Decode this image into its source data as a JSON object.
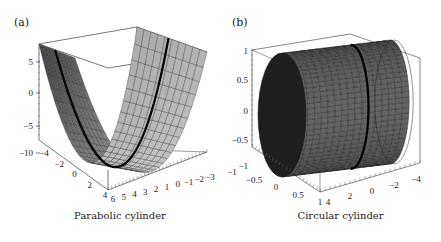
{
  "figure": {
    "panels": [
      {
        "label": "(a)",
        "caption": "Parabolic cylinder"
      },
      {
        "label": "(b)",
        "caption": "Circular cylinder"
      }
    ]
  },
  "chart_data": [
    {
      "type": "surface3d",
      "title": "Parabolic cylinder",
      "panel_label": "(a)",
      "surface": "z = x^2 - c (parabolic cylinder, extruded along y)",
      "z_axis": {
        "ticks": [
          "5",
          "0",
          "-5",
          "-10"
        ],
        "range": [
          -12,
          7
        ]
      },
      "x_axis": {
        "ticks": [
          "-4",
          "-2",
          "0",
          "2",
          "4"
        ],
        "range": [
          -5,
          5
        ]
      },
      "y_axis": {
        "ticks": [
          "6",
          "5",
          "4",
          "3",
          "2",
          "1",
          "0",
          "-1",
          "-2",
          "-3"
        ],
        "range": [
          -3,
          6
        ]
      },
      "highlight_curve": "thick black parabola cross-section drawn on surface",
      "colors": {
        "surface_dark": "#3a3a3a",
        "surface_light": "#cfcfcf",
        "mesh": "#222222",
        "curve": "#000000",
        "box": "#555555"
      }
    },
    {
      "type": "surface3d",
      "title": "Circular cylinder",
      "panel_label": "(b)",
      "surface": "x^2 + z^2 = 1 (circular cylinder, extruded along y)",
      "z_axis": {
        "ticks": [
          "1",
          "0.5",
          "0",
          "-0.5",
          "-1"
        ],
        "range": [
          -1,
          1
        ]
      },
      "x_axis": {
        "ticks": [
          "-1",
          "-0.5",
          "0",
          "0.5",
          "1"
        ],
        "range": [
          -1,
          1
        ]
      },
      "y_axis": {
        "ticks": [
          "4",
          "2",
          "0",
          "-2",
          "-4"
        ],
        "range": [
          -5,
          5
        ]
      },
      "highlight_curve": "thick black circle cross-section drawn on surface",
      "colors": {
        "surface_dark": "#2a2a2a",
        "surface_light": "#6a6a6a",
        "mesh": "#111111",
        "curve": "#000000",
        "box": "#555555"
      }
    }
  ]
}
